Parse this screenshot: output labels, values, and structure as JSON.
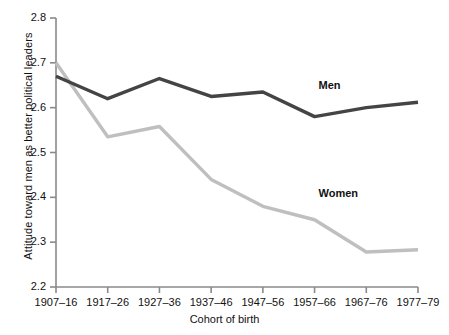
{
  "chart_data": {
    "type": "line",
    "title": "",
    "xlabel": "Cohort of birth",
    "ylabel": "Attitude toward men as better political leaders",
    "categories": [
      "1907–16",
      "1917–26",
      "1927–36",
      "1937–46",
      "1947–56",
      "1957–66",
      "1967–76",
      "1977–79"
    ],
    "ylim": [
      2.2,
      2.8
    ],
    "yticks": [
      "2.2",
      "2.3",
      "2.4",
      "2.5",
      "2.6",
      "2.7",
      "2.8"
    ],
    "ytick_values": [
      2.2,
      2.3,
      2.4,
      2.5,
      2.6,
      2.7,
      2.8
    ],
    "grid": false,
    "legend_position": "inline-annotation",
    "series": [
      {
        "name": "Men",
        "color": "#444444",
        "values": [
          2.67,
          2.62,
          2.665,
          2.625,
          2.635,
          2.58,
          2.6,
          2.612
        ]
      },
      {
        "name": "Women",
        "color": "#bfbfbf",
        "values": [
          2.7,
          2.535,
          2.558,
          2.44,
          2.38,
          2.35,
          2.278,
          2.283
        ]
      }
    ],
    "annotations": [
      {
        "text": "Men",
        "x_index": 5,
        "y": 2.648
      },
      {
        "text": "Women",
        "x_index": 5,
        "y": 2.408
      }
    ]
  },
  "axis": {
    "line_color": "#8a8a8a"
  }
}
